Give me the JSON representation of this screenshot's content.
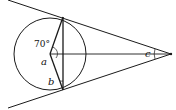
{
  "diagram": {
    "labels": {
      "angle_given": "70°",
      "a": "a",
      "b": "b",
      "c": "c"
    },
    "colors": {
      "stroke": "#1a1a1a",
      "background": "#ffffff"
    }
  }
}
